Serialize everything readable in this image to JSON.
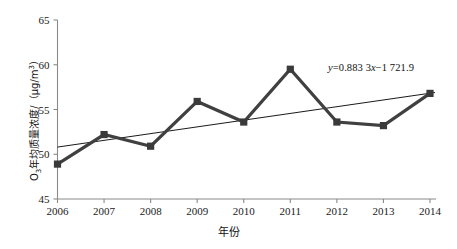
{
  "chart_data": {
    "type": "line",
    "title": "",
    "xlabel": "年份",
    "ylabel_main": "O",
    "ylabel_sub": "3",
    "ylabel_rest": "年均质量浓度/（μg/m",
    "ylabel_sup": "3",
    "ylabel_tail": "）",
    "ylabel_full": "O3年均质量浓度/（μg/m3）",
    "categories": [
      "2006",
      "2007",
      "2008",
      "2009",
      "2010",
      "2011",
      "2012",
      "2013",
      "2014"
    ],
    "x": [
      2006,
      2007,
      2008,
      2009,
      2010,
      2011,
      2012,
      2013,
      2014
    ],
    "values": [
      48.9,
      52.2,
      50.9,
      55.9,
      53.6,
      59.5,
      53.6,
      53.2,
      56.8
    ],
    "series": [
      {
        "name": "O3年均质量浓度",
        "values": [
          48.9,
          52.2,
          50.9,
          55.9,
          53.6,
          59.5,
          53.6,
          53.2,
          56.8
        ],
        "marker": "square",
        "color": "#3a3a3a"
      }
    ],
    "trendline": {
      "equation_text": "y = 0.883 3x − 1 721.9",
      "equation_y": "y",
      "equation_eq": "=",
      "equation_slope": "0.883 3",
      "equation_var": "x",
      "equation_minus": "−",
      "equation_intercept": "1 721.9",
      "slope": 0.8833,
      "intercept": -1721.9,
      "y_start": 50.8,
      "y_end": 56.9,
      "color": "#1a1a1a"
    },
    "ylim": [
      45,
      65
    ],
    "yticks": [
      45,
      50,
      55,
      60,
      65
    ],
    "ytick_labels": [
      "45",
      "50",
      "55",
      "60",
      "65"
    ],
    "xtick_labels": [
      "2006",
      "2007",
      "2008",
      "2009",
      "2010",
      "2011",
      "2012",
      "2013",
      "2014"
    ],
    "grid": false,
    "legend": "none",
    "axis_color": "#8a8a8a",
    "background": "#ffffff"
  }
}
